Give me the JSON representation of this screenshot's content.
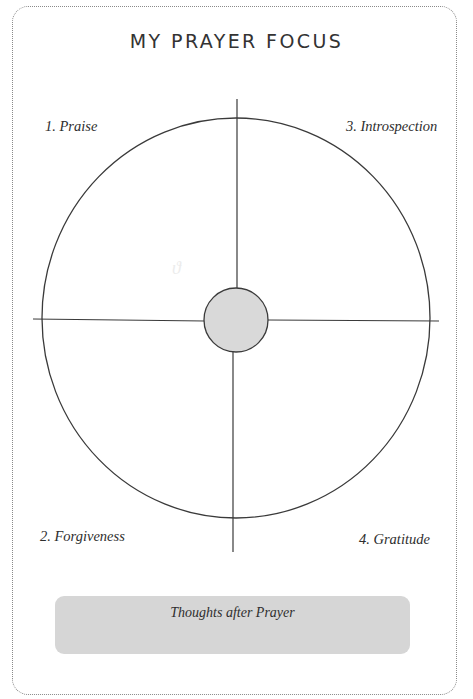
{
  "page": {
    "title": "MY PRAYER FOCUS"
  },
  "diagram": {
    "quadrants": [
      {
        "id": "praise",
        "label": "1. Praise",
        "position": "top-left"
      },
      {
        "id": "forgiveness",
        "label": "2. Forgiveness",
        "position": "bottom-left"
      },
      {
        "id": "introspection",
        "label": "3. Introspection",
        "position": "top-right"
      },
      {
        "id": "gratitude",
        "label": "4. Gratitude",
        "position": "bottom-right"
      }
    ],
    "center_fill": "#d9d9d9",
    "stroke_color": "#3a3a3a"
  },
  "footer": {
    "thoughts_label": "Thoughts after Prayer",
    "box_color": "#d6d6d6"
  }
}
